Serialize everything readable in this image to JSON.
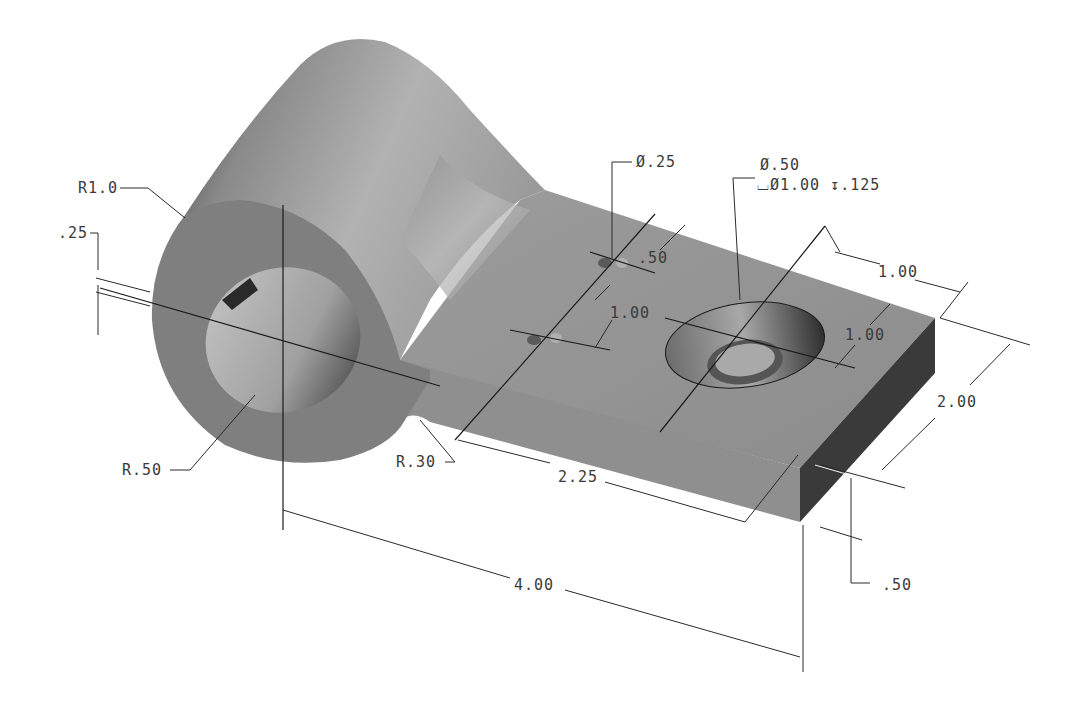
{
  "drawing": {
    "type": "isometric engineering drawing",
    "part": "link bracket with cylindrical boss and flat arm",
    "colors": {
      "background": "#ffffff",
      "body_light": "#a8a8a8",
      "body_mid": "#8e8e8e",
      "body_dark": "#3c3c3c",
      "boss_face": "#7f7f7f",
      "dimension_line": "#2a2a2a",
      "text": "#3a3a3a"
    }
  },
  "dimensions": {
    "boss_radius": "R1.0",
    "hole_radius": "R.50",
    "fillet_radius": "R.30",
    "slot_offset": ".25",
    "small_hole_dia": "Ø.25",
    "cbore_hole_dia": "Ø.50",
    "cbore_spec": "⌴Ø1.00 ↧.125",
    "small_hole_spacing": ".50",
    "small_hole_pitch": "1.00",
    "cbore_from_end": "1.00",
    "cbore_from_edge": "1.00",
    "arm_width": "2.00",
    "arm_thickness": ".50",
    "hole_to_hole": "2.25",
    "overall_length": "4.00"
  }
}
